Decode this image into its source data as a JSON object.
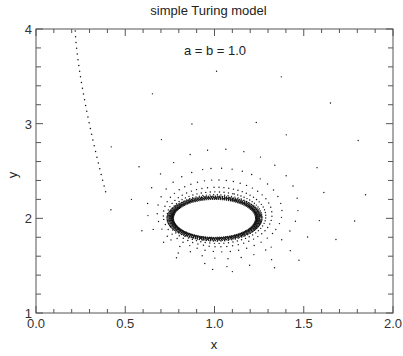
{
  "chart_data": {
    "type": "scatter",
    "title": "simple Turing model",
    "annotation": "a = b = 1.0",
    "xlabel": "x",
    "ylabel": "y",
    "xlim": [
      0.0,
      2.0
    ],
    "ylim": [
      1,
      4
    ],
    "xticks": [
      "0.0",
      "0.5",
      "1.0",
      "1.5",
      "2.0"
    ],
    "yticks": [
      "1",
      "2",
      "3",
      "4"
    ],
    "x_minor_step": 0.1,
    "y_minor_step": 0.2,
    "grid": false,
    "legend": null,
    "series": [
      {
        "name": "trajectory",
        "marker": "dot",
        "description": "Phase-plane trajectory starting near (0.22, 3.98), descending along left side, sweeping to a max y ~3.55 near x ~1.0, rightmost x ~1.85, spiraling inward onto a limit cycle centered at (1.0, 2.0)",
        "start": [
          0.22,
          3.98
        ],
        "key_points": [
          {
            "x": 0.22,
            "y": 3.98
          },
          {
            "x": 0.25,
            "y": 3.6
          },
          {
            "x": 0.32,
            "y": 3.0
          },
          {
            "x": 0.42,
            "y": 2.3
          },
          {
            "x": 0.55,
            "y": 2.6
          },
          {
            "x": 0.75,
            "y": 3.45
          },
          {
            "x": 1.0,
            "y": 3.55
          },
          {
            "x": 1.55,
            "y": 3.2
          },
          {
            "x": 1.85,
            "y": 2.5
          },
          {
            "x": 1.7,
            "y": 1.85
          },
          {
            "x": 1.3,
            "y": 1.6
          },
          {
            "x": 0.8,
            "y": 1.65
          }
        ],
        "limit_cycle": {
          "cx": 1.0,
          "cy": 2.0,
          "rx": 0.23,
          "ry": 0.2
        }
      }
    ]
  }
}
